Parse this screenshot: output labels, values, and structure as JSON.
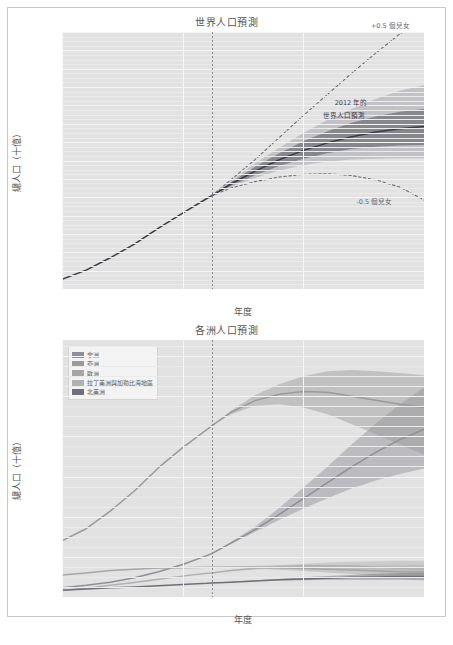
{
  "figure": {
    "background": "#ffffff",
    "frame_color": "#c9c9c9",
    "plot_background": "#e2e2e2",
    "grid_color": "#f4f4f4",
    "now_line_color": "#8a8a8a"
  },
  "panels": [
    {
      "id": "world",
      "title": "世界人口預測",
      "xlabel": "年度",
      "ylabel": "總人口（十億）",
      "annotations": [
        {
          "name": "upper-variant-label",
          "text": "+0.5 個兒女"
        },
        {
          "name": "lower-variant-label",
          "text": "-0.5 個兒女"
        },
        {
          "name": "median-projection-label-line1",
          "text": "2012 年的"
        },
        {
          "name": "median-projection-label-line2",
          "text": "世界人口預測"
        }
      ]
    },
    {
      "id": "continents",
      "title": "各洲人口預測",
      "xlabel": "年度",
      "ylabel": "總人口（十億）",
      "legend": {
        "items": [
          {
            "label": "非洲",
            "color": "#8e8e96"
          },
          {
            "label": "亞洲",
            "color": "#9a9a9a"
          },
          {
            "label": "歐洲",
            "color": "#a6a6a6"
          },
          {
            "label": "拉丁美洲與加勒比海地區",
            "color": "#b0b0b0"
          },
          {
            "label": "北美洲",
            "color": "#6f6f78"
          }
        ]
      }
    }
  ],
  "chart_data": [
    {
      "type": "line",
      "id": "world-population-projection",
      "title": "世界人口預測",
      "xlabel": "年度",
      "ylabel": "總人口（十億）",
      "xlim": [
        1950,
        2100
      ],
      "ylim": [
        2,
        16
      ],
      "xticks": [
        1950,
        2000,
        2050,
        2100
      ],
      "yticks": [
        2,
        3,
        4,
        5,
        6,
        7,
        8,
        9,
        10,
        11,
        12,
        13,
        14,
        15,
        16
      ],
      "grid": true,
      "legend_position": "none",
      "vertical_reference_year": 2012,
      "x": [
        1950,
        1960,
        1970,
        1980,
        1990,
        2000,
        2010,
        2012,
        2020,
        2030,
        2040,
        2050,
        2060,
        2070,
        2080,
        2090,
        2100
      ],
      "series": [
        {
          "name": "歷史與中位數預測",
          "style": "solid",
          "color": "#3c3c46",
          "values": [
            2.53,
            3.03,
            3.7,
            4.45,
            5.32,
            6.13,
            6.93,
            7.08,
            7.72,
            8.42,
            9.04,
            9.55,
            9.96,
            10.29,
            10.55,
            10.73,
            10.85
          ]
        },
        {
          "name": "+0.5 個兒女",
          "style": "dashed",
          "color": "#6d6d75",
          "values": [
            null,
            null,
            null,
            null,
            null,
            null,
            null,
            7.08,
            7.95,
            9.05,
            10.25,
            11.45,
            12.6,
            13.75,
            14.85,
            15.9,
            16.6
          ]
        },
        {
          "name": "-0.5 個兒女",
          "style": "dashed",
          "color": "#6d6d75",
          "values": [
            null,
            null,
            null,
            null,
            null,
            null,
            null,
            7.08,
            7.5,
            7.85,
            8.1,
            8.25,
            8.28,
            8.18,
            7.95,
            7.55,
            6.85
          ]
        }
      ],
      "uncertainty_bands": [
        {
          "name": "80% 預測區間",
          "color": "#55555f",
          "opacity": 0.55,
          "lower": [
            null,
            null,
            null,
            null,
            null,
            null,
            null,
            7.08,
            7.62,
            8.2,
            8.7,
            9.1,
            9.4,
            9.62,
            9.75,
            9.82,
            9.85
          ],
          "upper": [
            null,
            null,
            null,
            null,
            null,
            null,
            null,
            7.08,
            7.82,
            8.66,
            9.4,
            10.05,
            10.6,
            11.05,
            11.4,
            11.65,
            11.8
          ]
        },
        {
          "name": "95% 預測區間",
          "color": "#a6a6ae",
          "opacity": 0.55,
          "lower": [
            null,
            null,
            null,
            null,
            null,
            null,
            null,
            7.08,
            7.55,
            8.05,
            8.45,
            8.75,
            8.95,
            9.05,
            9.1,
            9.12,
            9.12
          ],
          "upper": [
            null,
            null,
            null,
            null,
            null,
            null,
            null,
            7.08,
            7.9,
            8.85,
            9.7,
            10.5,
            11.2,
            11.8,
            12.35,
            12.8,
            13.1
          ]
        }
      ]
    },
    {
      "type": "line",
      "id": "continental-population-projection",
      "title": "各洲人口預測",
      "xlabel": "年度",
      "ylabel": "總人口（十億）",
      "xlim": [
        1950,
        2100
      ],
      "ylim": [
        0,
        6.4
      ],
      "xticks": [
        1950,
        2000,
        2050,
        2100
      ],
      "yticks": [
        0,
        1,
        2,
        3,
        4,
        5,
        6
      ],
      "grid": true,
      "legend_position": "upper-left",
      "vertical_reference_year": 2012,
      "x": [
        1950,
        1960,
        1970,
        1980,
        1990,
        2000,
        2010,
        2012,
        2020,
        2030,
        2040,
        2050,
        2060,
        2070,
        2080,
        2090,
        2100
      ],
      "series": [
        {
          "name": "非洲",
          "color": "#8e8e96",
          "values": [
            0.23,
            0.29,
            0.37,
            0.48,
            0.63,
            0.81,
            1.03,
            1.08,
            1.34,
            1.68,
            2.06,
            2.45,
            2.85,
            3.24,
            3.6,
            3.92,
            4.18
          ],
          "band_lower": [
            null,
            null,
            null,
            null,
            null,
            null,
            null,
            1.08,
            1.32,
            1.62,
            1.92,
            2.2,
            2.46,
            2.7,
            2.9,
            3.06,
            3.2
          ],
          "band_upper": [
            null,
            null,
            null,
            null,
            null,
            null,
            null,
            1.08,
            1.37,
            1.75,
            2.22,
            2.72,
            3.25,
            3.8,
            4.32,
            4.8,
            5.22
          ]
        },
        {
          "name": "亞洲",
          "color": "#9a9a9a",
          "values": [
            1.4,
            1.7,
            2.14,
            2.64,
            3.22,
            3.72,
            4.17,
            4.26,
            4.6,
            4.89,
            5.05,
            5.12,
            5.1,
            5.0,
            4.9,
            4.8,
            4.72
          ],
          "band_lower": [
            null,
            null,
            null,
            null,
            null,
            null,
            null,
            4.26,
            4.55,
            4.76,
            4.8,
            4.72,
            4.55,
            4.3,
            4.05,
            3.8,
            3.55
          ],
          "band_upper": [
            null,
            null,
            null,
            null,
            null,
            null,
            null,
            4.26,
            4.64,
            5.03,
            5.3,
            5.5,
            5.62,
            5.65,
            5.62,
            5.58,
            5.52
          ]
        },
        {
          "name": "歐洲",
          "color": "#a6a6a6",
          "values": [
            0.55,
            0.6,
            0.66,
            0.69,
            0.72,
            0.73,
            0.74,
            0.74,
            0.74,
            0.74,
            0.73,
            0.71,
            0.69,
            0.67,
            0.65,
            0.63,
            0.62
          ],
          "band_lower": [
            null,
            null,
            null,
            null,
            null,
            null,
            null,
            0.74,
            0.73,
            0.71,
            0.68,
            0.65,
            0.61,
            0.57,
            0.53,
            0.5,
            0.47
          ],
          "band_upper": [
            null,
            null,
            null,
            null,
            null,
            null,
            null,
            0.74,
            0.76,
            0.78,
            0.79,
            0.79,
            0.78,
            0.78,
            0.78,
            0.79,
            0.8
          ]
        },
        {
          "name": "拉丁美洲與加勒比海地區",
          "color": "#b0b0b0",
          "values": [
            0.17,
            0.22,
            0.29,
            0.36,
            0.44,
            0.52,
            0.59,
            0.6,
            0.66,
            0.71,
            0.75,
            0.78,
            0.78,
            0.77,
            0.75,
            0.72,
            0.69
          ],
          "band_lower": [
            null,
            null,
            null,
            null,
            null,
            null,
            null,
            0.6,
            0.65,
            0.69,
            0.71,
            0.71,
            0.69,
            0.66,
            0.62,
            0.58,
            0.54
          ],
          "band_upper": [
            null,
            null,
            null,
            null,
            null,
            null,
            null,
            0.6,
            0.67,
            0.74,
            0.79,
            0.83,
            0.86,
            0.88,
            0.89,
            0.9,
            0.9
          ]
        },
        {
          "name": "北美洲",
          "color": "#6f6f78",
          "values": [
            0.17,
            0.2,
            0.23,
            0.25,
            0.28,
            0.31,
            0.34,
            0.35,
            0.37,
            0.4,
            0.43,
            0.45,
            0.47,
            0.49,
            0.5,
            0.51,
            0.51
          ],
          "band_lower": [
            null,
            null,
            null,
            null,
            null,
            null,
            null,
            0.35,
            0.37,
            0.39,
            0.41,
            0.42,
            0.43,
            0.43,
            0.43,
            0.43,
            0.42
          ],
          "band_upper": [
            null,
            null,
            null,
            null,
            null,
            null,
            null,
            0.35,
            0.38,
            0.42,
            0.45,
            0.49,
            0.52,
            0.55,
            0.58,
            0.6,
            0.62
          ]
        }
      ]
    }
  ]
}
